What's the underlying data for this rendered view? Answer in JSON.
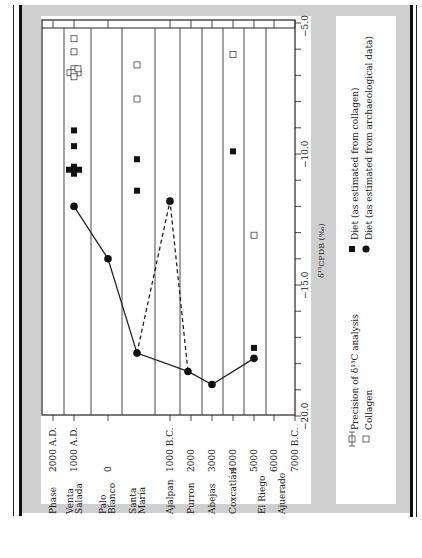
{
  "chart_data": {
    "type": "scatter",
    "orientation": "rotated 90 degrees counter-clockwise (time axis runs horizontally at bottom, delta-13C axis runs vertically at right)",
    "title": "",
    "xlabel": "δ¹³C_PDB (‰)",
    "ylabel": "Phase",
    "x_axis": {
      "label": "δ¹³C_PDB (‰)",
      "range": [
        -20.0,
        -5.0
      ],
      "ticks": [
        "-20.0",
        "-15.0",
        "-10.0",
        "-5.0"
      ],
      "minor_tick_step": 1.0
    },
    "time_axis": {
      "ticks": [
        "2000 A.D.",
        "1000 A.D.",
        "0",
        "1000 B.C.",
        "2000",
        "3000",
        "4000",
        "5000",
        "6000",
        "7000 B.C."
      ]
    },
    "phases": [
      "Venta Salada",
      "Palo Blanco",
      "Santa María",
      "Ajalpan",
      "Purron",
      "Abejas",
      "Coxcatlán",
      "El Riego",
      "Ajuerado"
    ],
    "series": [
      {
        "name": "Collagen",
        "marker": "open-square",
        "points": [
          {
            "time": "1000 A.D.",
            "d13c": -5.6
          },
          {
            "time": "1000 A.D.",
            "d13c": -6.1
          },
          {
            "time": "1000 A.D.",
            "d13c": -6.9,
            "note": "cluster of ~5"
          },
          {
            "time": "500 B.C.",
            "d13c": -6.6
          },
          {
            "time": "500 B.C.",
            "d13c": -7.9
          },
          {
            "time": "4000 B.C.",
            "d13c": -6.2
          },
          {
            "time": "5000 B.C.",
            "d13c": -13.1
          }
        ]
      },
      {
        "name": "Diet (as estimated from collagen)",
        "marker": "filled-square",
        "points": [
          {
            "time": "1000 A.D.",
            "d13c": -9.1
          },
          {
            "time": "1000 A.D.",
            "d13c": -9.7
          },
          {
            "time": "1000 A.D.",
            "d13c": -10.6,
            "note": "cluster of ~5"
          },
          {
            "time": "500 B.C.",
            "d13c": -10.2
          },
          {
            "time": "500 B.C.",
            "d13c": -11.4
          },
          {
            "time": "4000 B.C.",
            "d13c": -9.9
          },
          {
            "time": "5000 B.C.",
            "d13c": -17.4
          }
        ]
      },
      {
        "name": "Diet (as estimated from archaeological data)",
        "marker": "filled-circle",
        "line": "solid",
        "points": [
          {
            "time": "1000 A.D.",
            "d13c": -12.0
          },
          {
            "time": "0",
            "d13c": -14.0
          },
          {
            "time": "500 B.C.",
            "d13c": -17.6
          },
          {
            "time": "1750 B.C.",
            "d13c": -18.3
          },
          {
            "time": "3000 B.C.",
            "d13c": -18.8
          },
          {
            "time": "5000 B.C.",
            "d13c": -17.8
          }
        ]
      },
      {
        "name": "Diet (archaeological, alternative Ajalpan path)",
        "marker": "filled-circle",
        "line": "dashed",
        "points": [
          {
            "time": "500 B.C.",
            "d13c": -17.6
          },
          {
            "time": "1000 B.C.",
            "d13c": -11.8
          },
          {
            "time": "1750 B.C.",
            "d13c": -18.3
          }
        ]
      }
    ],
    "legend": [
      {
        "symbol": "precision-bar",
        "label": "Precision of δ¹³C analysis"
      },
      {
        "symbol": "open-square",
        "label": "Collagen"
      },
      {
        "symbol": "filled-square",
        "label": "Diet (as estimated from collagen)"
      },
      {
        "symbol": "filled-circle",
        "label": "Diet (as estimated from archaeological data)"
      }
    ],
    "grid": "vertical phase boundary lines",
    "legend_position": "right panel"
  },
  "labels": {
    "phase_header": "Phase",
    "phases": [
      {
        "l1": "Venta",
        "l2": "Salada"
      },
      {
        "l1": "Palo",
        "l2": "Blanco"
      },
      {
        "l1": "Santa",
        "l2": "María"
      },
      {
        "l1": "Ajalpan",
        "l2": ""
      },
      {
        "l1": "Purron",
        "l2": ""
      },
      {
        "l1": "Abejas",
        "l2": ""
      },
      {
        "l1": "Coxcatlán",
        "l2": ""
      },
      {
        "l1": "El Riego",
        "l2": ""
      },
      {
        "l1": "Ajuerado",
        "l2": ""
      }
    ],
    "time_ticks": [
      "2000 A.D.",
      "1000 A.D.",
      "0",
      "1000 B.C.",
      "2000",
      "3000",
      "4000",
      "5000",
      "6000",
      "7000 B.C."
    ],
    "d13c_ticks": [
      "−20.0",
      "−15.0",
      "−10.0",
      "−5.0"
    ],
    "d13c_axis_label": "δ¹³C",
    "d13c_axis_sub": "PDB",
    "d13c_axis_unit": "(‰)",
    "legend": {
      "precision": "Precision of δ¹³C analysis",
      "collagen": "Collagen",
      "diet_collagen": "Diet (as estimated from collagen)",
      "diet_arch": "Diet (as estimated from archaeological data)"
    }
  }
}
